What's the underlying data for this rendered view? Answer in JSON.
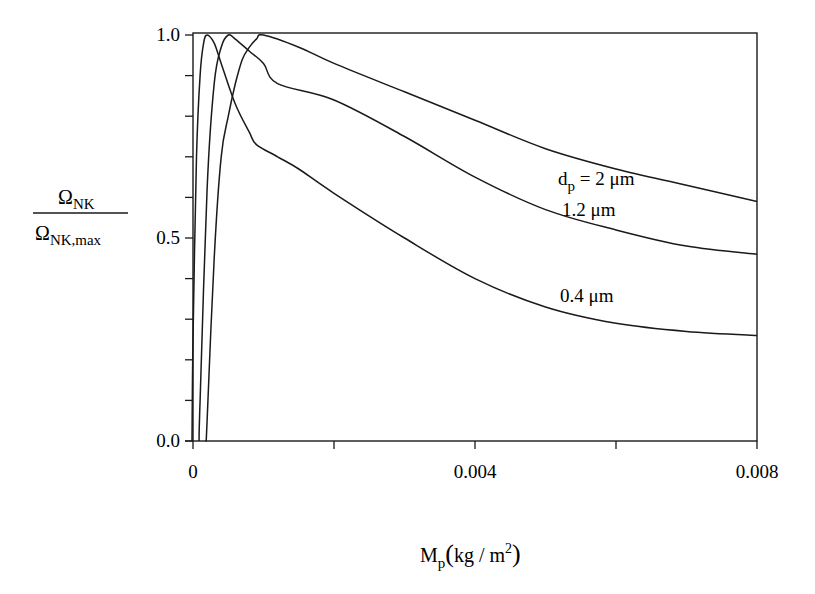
{
  "chart_data": {
    "type": "line",
    "title": "",
    "xlabel": "M_p (kg/m^2)",
    "ylabel": "Ω_NK / Ω_NK,max",
    "xlim": [
      0,
      0.008
    ],
    "ylim": [
      0.0,
      1.0
    ],
    "grid": false,
    "legend": "inline labels on curves",
    "x_ticks": [
      0,
      0.002,
      0.004,
      0.006,
      0.008
    ],
    "x_tick_labels": [
      "0",
      "",
      "0.004",
      "",
      "0.008"
    ],
    "y_ticks": [
      0.0,
      0.1,
      0.2,
      0.3,
      0.4,
      0.5,
      0.6,
      0.7,
      0.8,
      0.9,
      1.0
    ],
    "y_tick_labels": [
      "0.0",
      "",
      "",
      "",
      "",
      "0.5",
      "",
      "",
      "",
      "",
      "1.0"
    ],
    "series": [
      {
        "name": "d_p = 2 μm",
        "label": "dp = 2 μm",
        "x": [
          0.0002,
          0.0003,
          0.0004,
          0.0005,
          0.0006,
          0.0007,
          0.0008,
          0.0009,
          0.001,
          0.0015,
          0.002,
          0.003,
          0.004,
          0.005,
          0.006,
          0.007,
          0.008
        ],
        "values": [
          0.05,
          0.45,
          0.7,
          0.8,
          0.88,
          0.94,
          0.97,
          0.99,
          1.0,
          0.97,
          0.93,
          0.86,
          0.79,
          0.72,
          0.67,
          0.63,
          0.59
        ]
      },
      {
        "name": "1.2 μm",
        "label": "1.2 μm",
        "x": [
          0.0001,
          0.0002,
          0.0003,
          0.0004,
          0.0005,
          0.0006,
          0.0008,
          0.001,
          0.0012,
          0.002,
          0.003,
          0.004,
          0.005,
          0.006,
          0.007,
          0.008
        ],
        "values": [
          0.1,
          0.62,
          0.88,
          0.97,
          1.0,
          0.99,
          0.96,
          0.93,
          0.88,
          0.84,
          0.75,
          0.65,
          0.57,
          0.52,
          0.48,
          0.46
        ]
      },
      {
        "name": "0.4 μm",
        "label": "0.4 μm",
        "x": [
          0.0,
          5e-05,
          0.0001,
          0.00015,
          0.0002,
          0.0003,
          0.0004,
          0.0006,
          0.0008,
          0.0009,
          0.0012,
          0.0015,
          0.002,
          0.003,
          0.004,
          0.005,
          0.006,
          0.007,
          0.008
        ],
        "values": [
          0.25,
          0.7,
          0.9,
          0.98,
          1.0,
          0.98,
          0.93,
          0.83,
          0.76,
          0.73,
          0.7,
          0.67,
          0.61,
          0.5,
          0.4,
          0.33,
          0.29,
          0.27,
          0.26
        ]
      }
    ]
  },
  "labels": {
    "y_title_numerator": "Ω",
    "y_title_numerator_sub": "NK",
    "y_title_denominator": "Ω",
    "y_title_denominator_sub": "NK,max",
    "x_title_main": "M",
    "x_title_sub": "p",
    "x_title_unit": "kg / m",
    "x_title_sup": "2"
  }
}
